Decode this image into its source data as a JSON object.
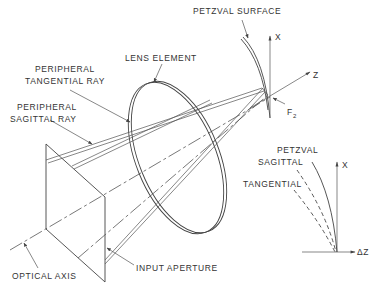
{
  "labels": {
    "petzval_surface": "PETZVAL SURFACE",
    "lens_element": "LENS ELEMENT",
    "peripheral_tangential_1": "PERIPHERAL",
    "peripheral_tangential_2": "TANGENTIAL RAY",
    "peripheral_sagittal_1": "PERIPHERAL",
    "peripheral_sagittal_2": "SAGITTAL RAY",
    "optical_axis": "OPTICAL AXIS",
    "input_aperture": "INPUT APERTURE",
    "axis_x": "X",
    "axis_z": "Z",
    "focal_point": "F",
    "focal_point_sub": "2",
    "inset_petzval": "PETZVAL",
    "inset_sagittal": "SAGITTAL",
    "inset_tangential": "TANGENTIAL",
    "inset_axis_x": "X",
    "inset_axis_dz": "ΔZ"
  },
  "colors": {
    "line": "#444444",
    "text": "#333333",
    "background": "#ffffff"
  }
}
